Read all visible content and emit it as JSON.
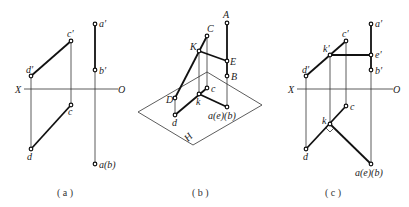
{
  "figure": {
    "panels": [
      {
        "id": "a",
        "caption": "( a )",
        "axis": {
          "left_label": "X",
          "right_label": "O"
        },
        "labels": {
          "a_prime": "a′",
          "b_prime": "b′",
          "c_prime": "c′",
          "d_prime": "d′",
          "c": "c",
          "d": "d",
          "ab": "a(b)"
        }
      },
      {
        "id": "b",
        "caption": "( b )",
        "labels": {
          "A": "A",
          "B": "B",
          "C": "C",
          "D": "D",
          "E": "E",
          "K": "K",
          "c": "c",
          "d": "d",
          "k": "k",
          "aeb": "a(e)(b)",
          "H": "H"
        }
      },
      {
        "id": "c",
        "caption": "( c )",
        "axis": {
          "left_label": "X",
          "right_label": "O"
        },
        "labels": {
          "a_prime": "a′",
          "b_prime": "b′",
          "c_prime": "c′",
          "d_prime": "d′",
          "e_prime": "e′",
          "k_prime": "k′",
          "c": "c",
          "d": "d",
          "k": "k",
          "aeb": "a(e)(b)"
        }
      }
    ]
  }
}
